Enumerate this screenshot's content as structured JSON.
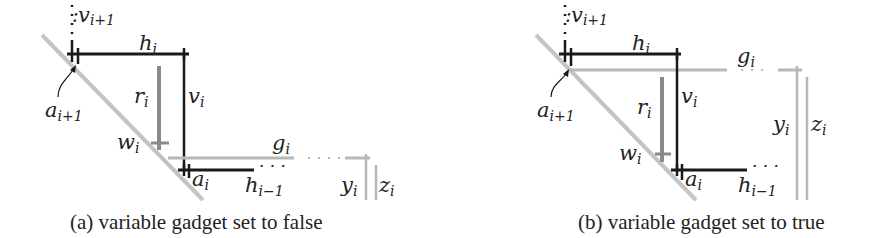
{
  "figure": {
    "panels": [
      {
        "id": "a",
        "caption": "(a) variable gadget set to false",
        "labels": {
          "v_next": {
            "base": "v",
            "sub": "i+1"
          },
          "h": {
            "base": "h",
            "sub": "i"
          },
          "a_next": {
            "base": "a",
            "sub": "i+1"
          },
          "r": {
            "base": "r",
            "sub": "i"
          },
          "v": {
            "base": "v",
            "sub": "i"
          },
          "w": {
            "base": "w",
            "sub": "i"
          },
          "g": {
            "base": "g",
            "sub": "i"
          },
          "a": {
            "base": "a",
            "sub": "i"
          },
          "h_prev": {
            "base": "h",
            "sub": "i−1"
          },
          "y": {
            "base": "y",
            "sub": "i"
          },
          "z": {
            "base": "z",
            "sub": "i"
          },
          "ellipsis": "· · ·"
        },
        "state": "false"
      },
      {
        "id": "b",
        "caption": "(b) variable gadget set to true",
        "labels": {
          "v_next": {
            "base": "v",
            "sub": "i+1"
          },
          "h": {
            "base": "h",
            "sub": "i"
          },
          "a_next": {
            "base": "a",
            "sub": "i+1"
          },
          "r": {
            "base": "r",
            "sub": "i"
          },
          "v": {
            "base": "v",
            "sub": "i"
          },
          "w": {
            "base": "w",
            "sub": "i"
          },
          "g": {
            "base": "g",
            "sub": "i"
          },
          "a": {
            "base": "a",
            "sub": "i"
          },
          "h_prev": {
            "base": "h",
            "sub": "i−1"
          },
          "y": {
            "base": "y",
            "sub": "i"
          },
          "z": {
            "base": "z",
            "sub": "i"
          },
          "ellipsis": "· · ·"
        },
        "state": "true"
      }
    ],
    "colors": {
      "black_segment": "#1a1a1a",
      "gray_segment": "#b8b8b8",
      "dark_gray_segment": "#8a8a8a",
      "diagonal": "#c4c4c4",
      "text": "#222222"
    }
  }
}
